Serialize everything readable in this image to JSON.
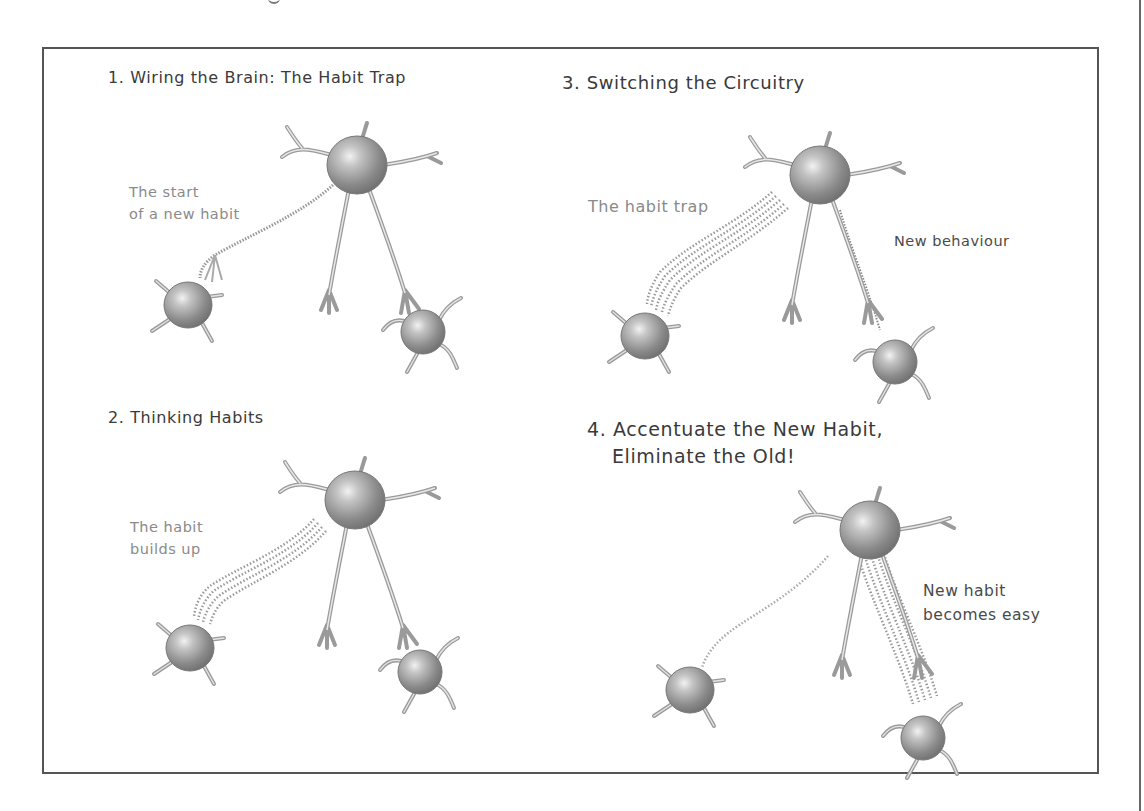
{
  "figure": {
    "panels": [
      {
        "id": "panel-1",
        "title": "1. Wiring the Brain: The Habit Trap",
        "labels": [
          {
            "line1": "The start",
            "line2": "of a new habit"
          }
        ],
        "pathway_strength": "faint"
      },
      {
        "id": "panel-2",
        "title": "2. Thinking Habits",
        "labels": [
          {
            "line1": "The habit",
            "line2": "builds up"
          }
        ],
        "pathway_strength": "strong"
      },
      {
        "id": "panel-3",
        "title": "3. Switching the Circuitry",
        "labels": [
          {
            "line1": "The habit trap"
          },
          {
            "line1": "New behaviour"
          }
        ],
        "pathway_strength": "strong-old, faint-new"
      },
      {
        "id": "panel-4",
        "title_line1": "4. Accentuate the New Habit,",
        "title_line2": "Eliminate the Old!",
        "labels": [
          {
            "line1": "New habit",
            "line2": "becomes easy"
          }
        ],
        "pathway_strength": "faint-old, strong-new"
      }
    ],
    "icons": {
      "neuron": "neuron-cell-icon",
      "pathway": "neural-pathway-icon"
    },
    "colors": {
      "frame": "#555555",
      "heading": "#3a3a3a",
      "label_muted": "#8a8a8a",
      "label_dark": "#4a4a4a",
      "neuron_fill": "#a8a8a8",
      "pathway_dots": "#9a9a9a"
    }
  }
}
